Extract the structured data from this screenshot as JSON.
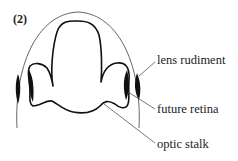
{
  "figure": {
    "panel_label": "(2)"
  },
  "labels": [
    {
      "text": "lens rudiment"
    },
    {
      "text": "future retina"
    },
    {
      "text": "optic stalk"
    }
  ]
}
